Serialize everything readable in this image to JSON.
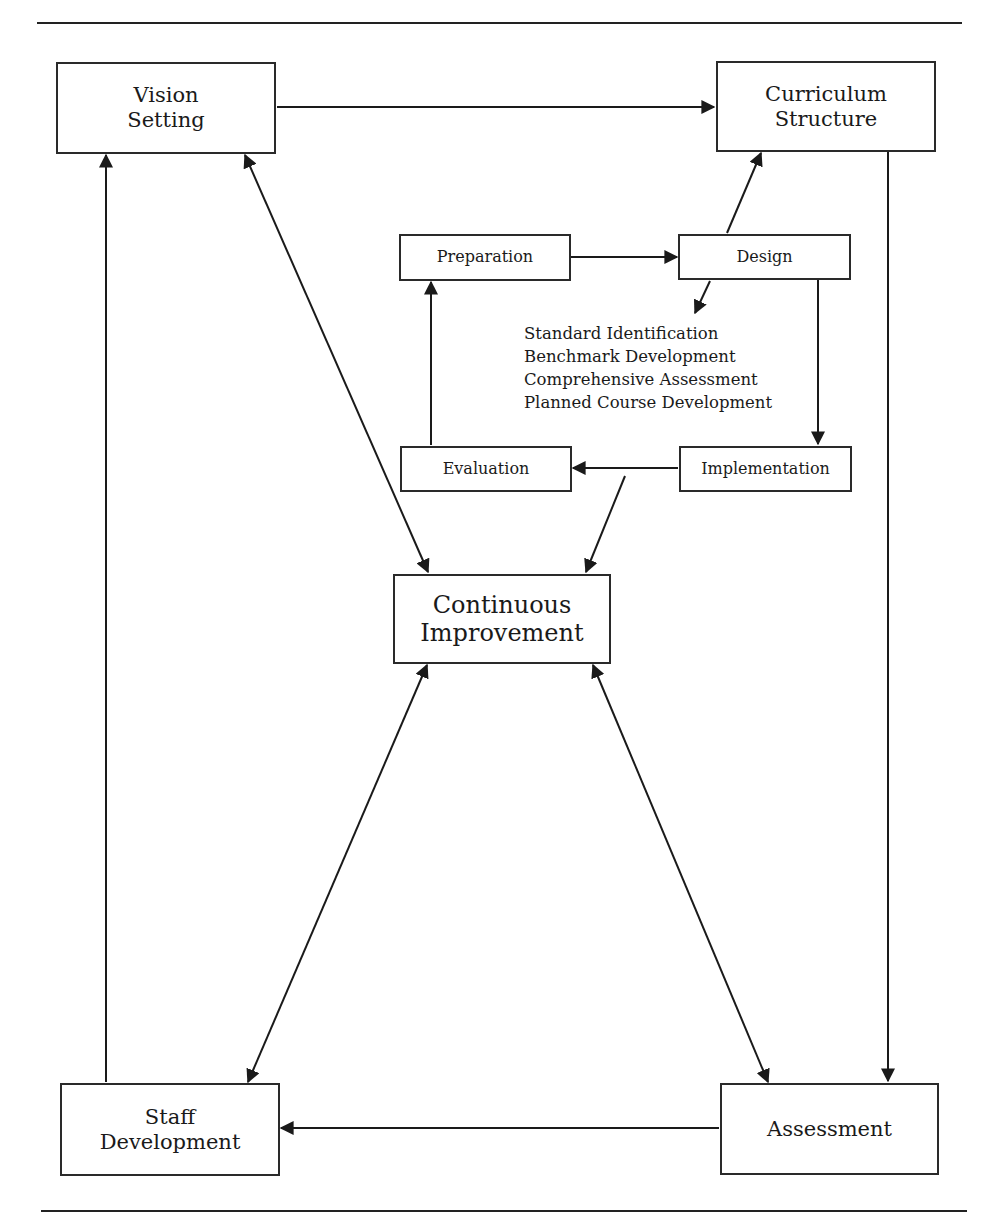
{
  "diagram": {
    "outer_nodes": {
      "vision_setting": [
        "Vision",
        "Setting"
      ],
      "curriculum_structure": [
        "Curriculum",
        "Structure"
      ],
      "staff_development": [
        "Staff",
        "Development"
      ],
      "assessment": [
        "Assessment"
      ]
    },
    "center_node": [
      "Continuous",
      "Improvement"
    ],
    "inner_cycle": {
      "preparation": "Preparation",
      "design": "Design",
      "implementation": "Implementation",
      "evaluation": "Evaluation"
    },
    "design_outputs": [
      "Standard Identification",
      "Benchmark Development",
      "Comprehensive Assessment",
      "Planned Course Development"
    ],
    "edges": [
      {
        "from": "Vision Setting",
        "to": "Curriculum Structure",
        "type": "directed"
      },
      {
        "from": "Curriculum Structure",
        "to": "Assessment",
        "type": "directed"
      },
      {
        "from": "Assessment",
        "to": "Staff Development",
        "type": "directed"
      },
      {
        "from": "Staff Development",
        "to": "Vision Setting",
        "type": "directed"
      },
      {
        "from": "Vision Setting",
        "to": "Continuous Improvement",
        "type": "bidirectional"
      },
      {
        "from": "Continuous Improvement",
        "to": "Staff Development",
        "type": "bidirectional"
      },
      {
        "from": "Continuous Improvement",
        "to": "Assessment",
        "type": "bidirectional"
      },
      {
        "from": "Preparation",
        "to": "Design",
        "type": "directed"
      },
      {
        "from": "Design",
        "to": "Implementation",
        "type": "directed"
      },
      {
        "from": "Implementation",
        "to": "Evaluation",
        "type": "directed"
      },
      {
        "from": "Evaluation",
        "to": "Preparation",
        "type": "directed"
      },
      {
        "from": "Design",
        "to": "Curriculum Structure",
        "type": "directed"
      },
      {
        "from": "Design",
        "to": "Design outputs list",
        "type": "directed"
      },
      {
        "from": "Implementation/Evaluation link",
        "to": "Continuous Improvement",
        "type": "directed"
      }
    ]
  }
}
